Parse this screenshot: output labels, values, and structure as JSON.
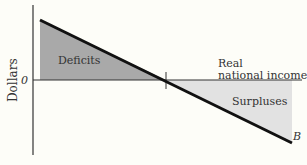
{
  "diagram": {
    "y_axis_label": "Dollars",
    "zero_label": "0",
    "x_axis_label_line1": "Real",
    "x_axis_label_line2": "national income",
    "region_left_label": "Deficits",
    "region_right_label": "Surpluses",
    "line_label": "B",
    "colors": {
      "background": "#fdfdf8",
      "deficit_fill": "#a9a9a9",
      "surplus_fill": "#e2e2e2",
      "line": "#111111",
      "axis": "#333333"
    }
  }
}
